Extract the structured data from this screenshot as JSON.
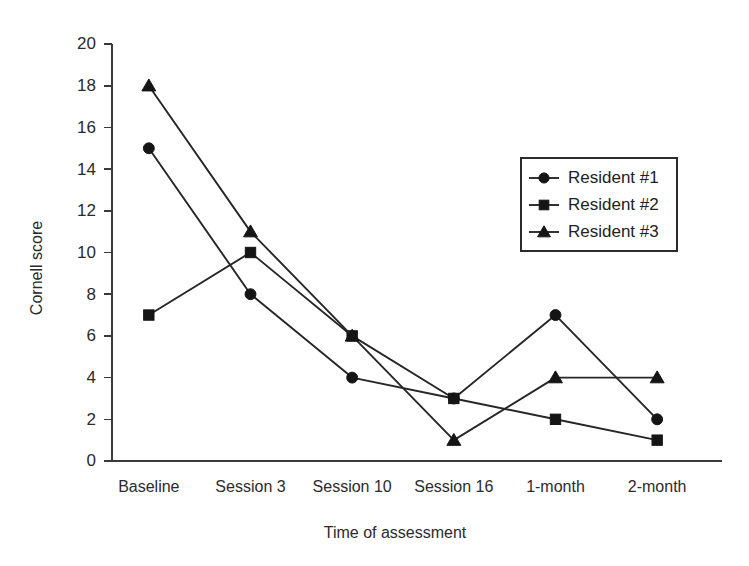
{
  "chart_data": {
    "type": "line",
    "title": "",
    "xlabel": "Time of assessment",
    "ylabel": "Cornell score",
    "categories": [
      "Baseline",
      "Session 3",
      "Session 10",
      "Session 16",
      "1-month",
      "2-month"
    ],
    "ylim": [
      0,
      20
    ],
    "yticks": [
      0,
      2,
      4,
      6,
      8,
      10,
      12,
      14,
      16,
      18,
      20
    ],
    "ytick_labels": [
      "0",
      "2",
      "4",
      "6",
      "8",
      "10",
      "12",
      "14",
      "16",
      "18",
      "20"
    ],
    "grid": false,
    "legend_position": "upper right",
    "series": [
      {
        "name": "Resident #1",
        "marker": "circle",
        "color": "#151515",
        "values": [
          15,
          8,
          4,
          3,
          7,
          2
        ]
      },
      {
        "name": "Resident #2",
        "marker": "square",
        "color": "#151515",
        "values": [
          7,
          10,
          6,
          3,
          2,
          1
        ]
      },
      {
        "name": "Resident #3",
        "marker": "triangle",
        "color": "#151515",
        "values": [
          18,
          11,
          6,
          1,
          4,
          4
        ]
      }
    ]
  },
  "axes": {
    "y_title": "Cornell score",
    "x_title": "Time of assessment"
  },
  "legend": {
    "entries": [
      {
        "label": "Resident #1",
        "marker": "circle"
      },
      {
        "label": "Resident #2",
        "marker": "square"
      },
      {
        "label": "Resident #3",
        "marker": "triangle"
      }
    ]
  },
  "colors": {
    "background": "#ffffff",
    "ink": "#262626",
    "marker": "#151515",
    "axis": "#3a3a3a"
  }
}
